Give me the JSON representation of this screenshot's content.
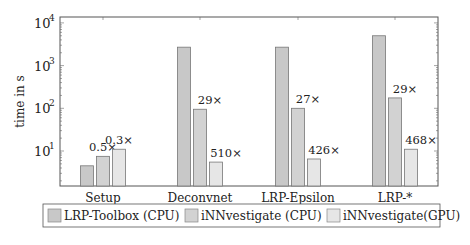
{
  "chart_data": {
    "type": "bar",
    "title": "",
    "xlabel": "",
    "ylabel": "time in s",
    "yscale": "log",
    "ylim": [
      1.5,
      10000
    ],
    "yticks": [
      {
        "label": "10",
        "exp": "1",
        "value": 10
      },
      {
        "label": "10",
        "exp": "2",
        "value": 100
      },
      {
        "label": "10",
        "exp": "3",
        "value": 1000
      },
      {
        "label": "10",
        "exp": "4",
        "value": 10000
      }
    ],
    "grid": false,
    "legend_position": "bottom",
    "categories": [
      "Setup",
      "Deconvnet",
      "LRP-Epsilon",
      "LRP-*"
    ],
    "series": [
      {
        "name": "LRP-Toolbox (CPU)",
        "color": "#c8c8c8",
        "values": [
          4.5,
          2700,
          2700,
          5000
        ],
        "annotations": [
          "",
          "",
          "",
          ""
        ]
      },
      {
        "name": "iNNvestigate (CPU)",
        "color": "#d2d2d2",
        "values": [
          7.5,
          95,
          100,
          175
        ],
        "annotations": [
          "0.5×",
          "29×",
          "27×",
          "29×"
        ]
      },
      {
        "name": "iNNvestigate(GPU)",
        "color": "#e6e6e6",
        "values": [
          11,
          5.5,
          6.5,
          11
        ],
        "annotations": [
          "0.3×",
          "510×",
          "426×",
          "468×"
        ]
      }
    ]
  }
}
